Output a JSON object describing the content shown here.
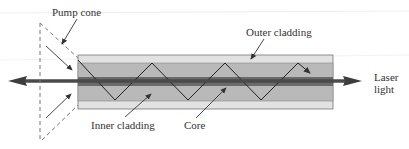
{
  "diagram": {
    "labels": {
      "pump_cone": "Pump cone",
      "outer_cladding": "Outer cladding",
      "inner_cladding": "Inner cladding",
      "core": "Core",
      "laser_line1": "Laser",
      "laser_line2": "light"
    },
    "colors": {
      "outer_cladding": "#e2e2e2",
      "inner_cladding": "#b9b9b9",
      "core": "#5a5a5a",
      "core_center": "#333333",
      "arrow": "#555555",
      "lines": "#333333",
      "dashed": "#777777"
    }
  }
}
